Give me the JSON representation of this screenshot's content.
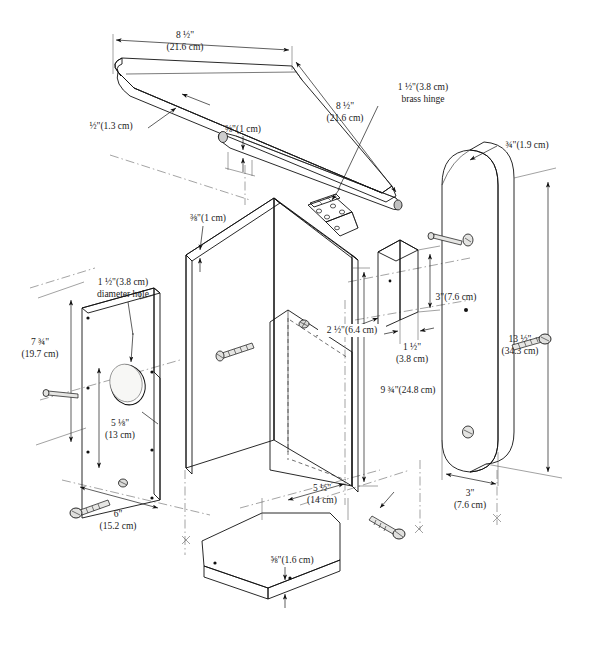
{
  "diagram": {
    "type": "exploded-assembly-technical-illustration",
    "background_color": "#ffffff",
    "line_color": "#111111",
    "fill_colors": [
      "#e2e2e0",
      "#d2d2d0",
      "#bcbcba",
      "#c9c9c7"
    ]
  },
  "labels": {
    "roof_top_width": {
      "imperial": "8 ½\"",
      "metric": "(21.6 cm)"
    },
    "roof_side_length": {
      "imperial": "8 ½\"",
      "metric": "(21.6 cm)"
    },
    "roof_thickness": {
      "imperial": "½\"",
      "metric": "(1.3 cm)"
    },
    "roof_cleat": {
      "imperial": "⅜\"",
      "metric": "(1 cm)"
    },
    "hinge": {
      "imperial": "1 ½\"",
      "metric": "(3.8 cm)",
      "note": "brass hinge"
    },
    "side_panel_thickness": {
      "imperial": "⅜\"",
      "metric": "(1 cm)"
    },
    "back_board_thickness": {
      "imperial": "¾\"",
      "metric": "(1.9 cm)"
    },
    "front_hole_diameter": {
      "imperial": "1 ½\"",
      "metric": "(3.8 cm)",
      "note": "diameter hole"
    },
    "front_panel_height": {
      "imperial": "7 ¾\"",
      "metric": "(19.7 cm)"
    },
    "hole_center_height": {
      "imperial": "5 ⅛\"",
      "metric": "(13 cm)"
    },
    "front_panel_width": {
      "imperial": "6\"",
      "metric": "(15.2 cm)"
    },
    "cleat_width": {
      "imperial": "2 ½\"",
      "metric": "(6.4 cm)"
    },
    "cleat_thickness": {
      "imperial": "1 ½\"",
      "metric": "(3.8 cm)"
    },
    "cleat_height": {
      "imperial": "3\"",
      "metric": "(7.6 cm)"
    },
    "side_panel_height": {
      "imperial": "9 ¾\"",
      "metric": "(24.8 cm)"
    },
    "back_board_height": {
      "imperial": "13 ½\"",
      "metric": "(34.3 cm)"
    },
    "back_board_width": {
      "imperial": "3\"",
      "metric": "(7.6 cm)"
    },
    "floor_width": {
      "imperial": "5 ½\"",
      "metric": "(14 cm)"
    },
    "floor_thickness": {
      "imperial": "⅝\"",
      "metric": "(1.6 cm)"
    }
  },
  "label_text": {
    "roof_top_width_line1": "8 ½\"",
    "roof_top_width_line2": "(21.6 cm)",
    "roof_side_length_line1": "8 ½\"",
    "roof_side_length_line2": "(21.6 cm)",
    "roof_thickness": "½\"(1.3 cm)",
    "roof_cleat": "⅜\"(1 cm)",
    "hinge_line1": "1 ½\"(3.8 cm)",
    "hinge_line2": "brass hinge",
    "side_panel_thickness": "⅜\"(1 cm)",
    "back_board_thickness": "¾\"(1.9 cm)",
    "front_hole_line1": "1 ½\"(3.8 cm)",
    "front_hole_line2": "diameter hole",
    "front_panel_height_line1": "7 ¾\"",
    "front_panel_height_line2": "(19.7 cm)",
    "hole_center_line1": "5 ⅛\"",
    "hole_center_line2": "(13 cm)",
    "front_panel_width_line1": "6\"",
    "front_panel_width_line2": "(15.2 cm)",
    "cleat_width": "2 ½\"(6.4 cm)",
    "cleat_thickness_line1": "1 ½\"",
    "cleat_thickness_line2": "(3.8 cm)",
    "cleat_height": "3\"(7.6 cm)",
    "side_panel_height": "9 ¾\"(24.8 cm)",
    "back_board_height_line1": "13 ½\"",
    "back_board_height_line2": "(34.3 cm)",
    "back_board_width_line1": "3\"",
    "back_board_width_line2": "(7.6 cm)",
    "floor_width_line1": "5 ½\"",
    "floor_width_line2": "(14 cm)",
    "floor_thickness": "⅝\"(1.6 cm)"
  },
  "parts": [
    {
      "name": "roof-panel",
      "label": "Roof panel"
    },
    {
      "name": "roof-cleat",
      "label": "Roof cleat"
    },
    {
      "name": "brass-hinge",
      "label": "Brass hinge"
    },
    {
      "name": "front-panel",
      "label": "Front panel with entrance hole"
    },
    {
      "name": "side-panel-left",
      "label": "Left side panel"
    },
    {
      "name": "side-panel-right",
      "label": "Right side panel"
    },
    {
      "name": "mounting-cleat",
      "label": "Mounting cleat block"
    },
    {
      "name": "back-board",
      "label": "Back mounting board"
    },
    {
      "name": "floor-panel",
      "label": "Floor panel"
    },
    {
      "name": "screw",
      "label": "Wood screw"
    }
  ]
}
